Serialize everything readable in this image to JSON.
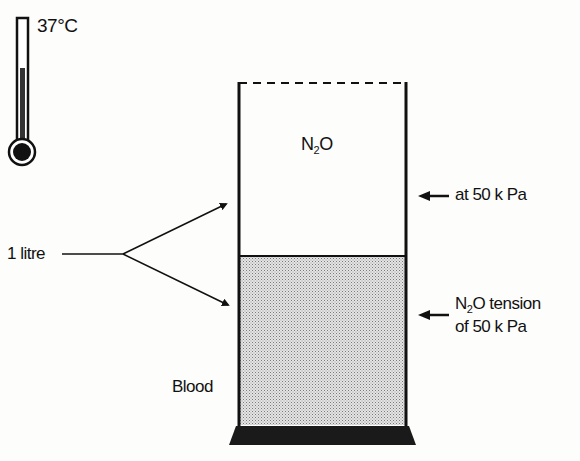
{
  "diagram": {
    "thermometer": {
      "temperature_label": "37°C",
      "icon": "thermometer-icon"
    },
    "gas_label": {
      "prefix": "N",
      "subscript": "2",
      "suffix": "O"
    },
    "pressure_label": "at 50 k Pa",
    "tension_label": {
      "line1_prefix": "N",
      "line1_subscript": "2",
      "line1_suffix": "O tension",
      "line2": "of 50 k Pa"
    },
    "volume_label": "1 litre",
    "blood_label": "Blood",
    "colors": {
      "ink": "#111111",
      "blood_fill": "#c9c9c9",
      "background": "#fdfdfb"
    }
  }
}
